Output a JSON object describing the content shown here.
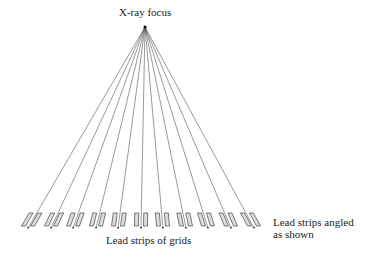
{
  "labels": {
    "focus": "X-ray focus",
    "grid": "Lead strips of grids",
    "angled_line1": "Lead strips angled",
    "angled_line2": "as shown"
  },
  "geometry": {
    "focus_point": [
      145,
      27
    ],
    "ray_end_y": 228,
    "ray_end_x": [
      28,
      51,
      73,
      96,
      118,
      141,
      163,
      186,
      208,
      231,
      254
    ],
    "strip_top_y": 213,
    "strip_bottom_y": 226,
    "strip_width": 4,
    "pair_half_gap": 4
  },
  "colors": {
    "line": "#555555",
    "strip_stroke": "#444444",
    "strip_fill": "#dddddd",
    "text": "#222222"
  }
}
